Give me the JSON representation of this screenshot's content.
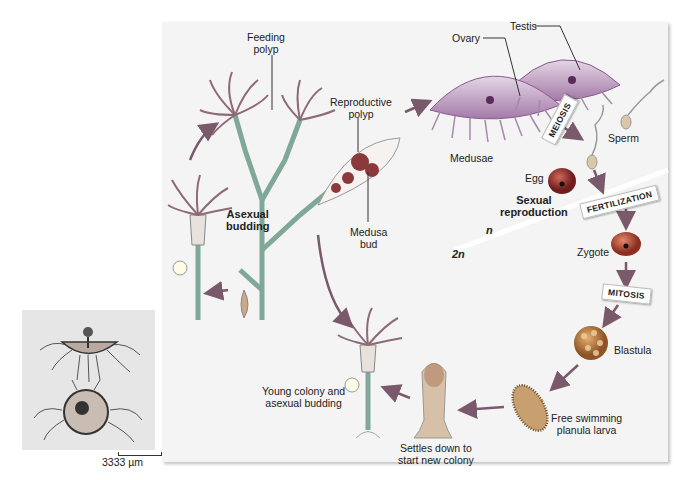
{
  "photo": {
    "scale_bar": "3333 µm",
    "subject": "hydrozoan-medusa-photograph"
  },
  "diagram": {
    "title_region": "Hydrozoan (Obelia) life cycle",
    "labels": {
      "feeding_polyp": [
        "Feeding",
        "polyp"
      ],
      "reproductive_polyp": [
        "Reproductive",
        "polyp"
      ],
      "medusa_bud": [
        "Medusa",
        "bud"
      ],
      "asexual_budding": [
        "Asexual",
        "budding"
      ],
      "ovary": "Ovary",
      "testis": "Testis",
      "medusae": "Medusae",
      "sperm": "Sperm",
      "egg": "Egg",
      "sexual_reproduction": [
        "Sexual",
        "reproduction"
      ],
      "haploid": "n",
      "diploid": "2n",
      "zygote": "Zygote",
      "blastula": "Blastula",
      "planula": [
        "Free swimming",
        "planula larva"
      ],
      "settles": [
        "Settles down to",
        "start new colony"
      ],
      "young_colony": [
        "Young colony and",
        "asexual budding"
      ]
    },
    "process_tags": {
      "meiosis": "MEIOSIS",
      "fertilization": "FERTILIZATION",
      "mitosis": "MITOSIS"
    },
    "colors": {
      "panel_bg": "#f4f4f4",
      "medusa": "#b58fb8",
      "medusa_rim": "#8a5a8e",
      "polyp": "#a9c6b8",
      "polyp_tentacle": "#8d6a76",
      "egg": "#8e2a2a",
      "zygote": "#a33c2c",
      "blastula": "#c48048",
      "planula": "#b48a52",
      "arrow": "#7a5a6a"
    }
  }
}
